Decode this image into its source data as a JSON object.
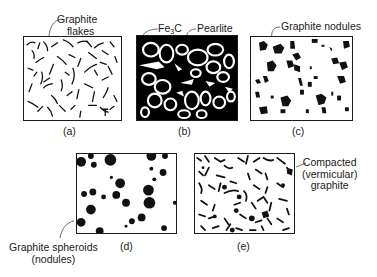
{
  "figure": {
    "panels": [
      {
        "id": "a",
        "caption": "(a)",
        "annotation": [
          "Graphite",
          "flakes"
        ],
        "fill": "#ffffff",
        "structure": "graphite-flakes"
      },
      {
        "id": "b",
        "caption": "(b)",
        "annotation_left": "Fe3C",
        "annotation_left_base": "Fe",
        "annotation_left_sub": "3",
        "annotation_left_tail": "C",
        "annotation_right": "Pearlite",
        "fill": "#000000",
        "structure": "white-cast-iron"
      },
      {
        "id": "c",
        "caption": "(c)",
        "annotation": "Graphite nodules",
        "fill": "#ffffff",
        "structure": "graphite-nodules"
      },
      {
        "id": "d",
        "caption": "(d)",
        "annotation": [
          "Graphite spheroids",
          "(nodules)"
        ],
        "fill": "#ffffff",
        "structure": "graphite-spheroids"
      },
      {
        "id": "e",
        "caption": "(e)",
        "annotation": [
          "Compacted",
          "(vermicular)",
          "graphite"
        ],
        "fill": "#ffffff",
        "structure": "compacted-graphite"
      }
    ],
    "colors": {
      "ink": "#1a1a1a",
      "background": "#ffffff"
    }
  }
}
